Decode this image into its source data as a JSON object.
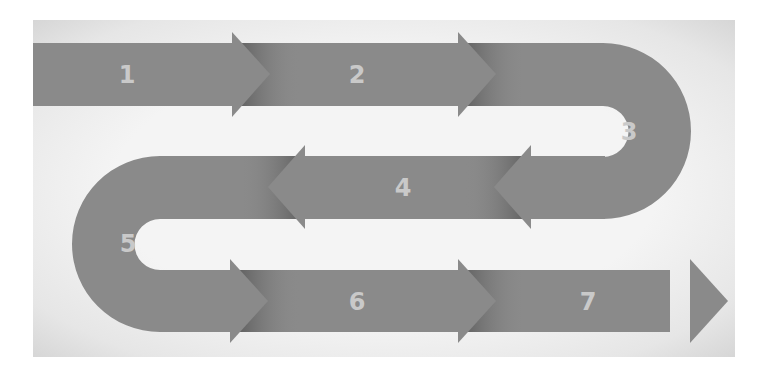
{
  "diagram": {
    "type": "serpentine-process-arrows",
    "steps": [
      {
        "label": "1",
        "direction": "right"
      },
      {
        "label": "2",
        "direction": "right"
      },
      {
        "label": "3",
        "direction": "u-turn-right"
      },
      {
        "label": "4",
        "direction": "left"
      },
      {
        "label": "5",
        "direction": "u-turn-left"
      },
      {
        "label": "6",
        "direction": "right"
      },
      {
        "label": "7",
        "direction": "right"
      }
    ]
  },
  "colors": {
    "arrow_fill": "#8a8a8a",
    "arrow_shadow": "#5e5e5e",
    "label": "#c9c9c9",
    "background": "#f2f2f2"
  }
}
